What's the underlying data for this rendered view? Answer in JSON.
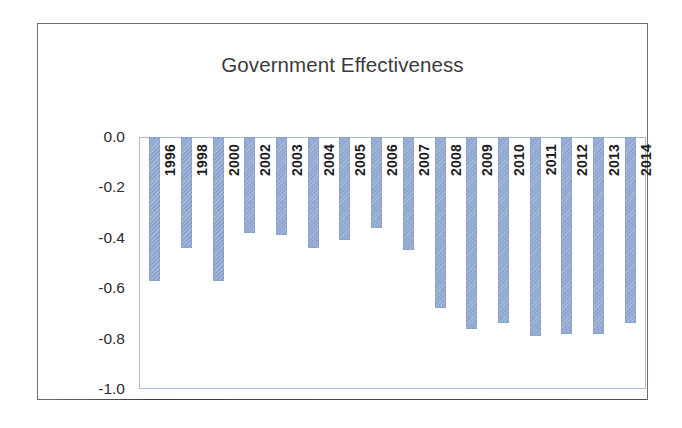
{
  "chart_data": {
    "type": "bar",
    "title": "Government Effectiveness",
    "xlabel": "",
    "ylabel": "",
    "ylim": [
      -1.0,
      0.0
    ],
    "grid": false,
    "legend": null,
    "bar_color": "#8fa8d0",
    "plot_border_color": "#a8bcd8",
    "frame_color": "#6e6e70",
    "yticks": [
      "0.0",
      "-0.2",
      "-0.4",
      "-0.6",
      "-0.8",
      "-1.0"
    ],
    "ytick_values": [
      0.0,
      -0.2,
      -0.4,
      -0.6,
      -0.8,
      -1.0
    ],
    "categories": [
      "1996",
      "1998",
      "2000",
      "2002",
      "2003",
      "2004",
      "2005",
      "2006",
      "2007",
      "2008",
      "2009",
      "2010",
      "2011",
      "2012",
      "2013",
      "2014"
    ],
    "values": [
      -0.57,
      -0.44,
      -0.57,
      -0.38,
      -0.39,
      -0.44,
      -0.41,
      -0.36,
      -0.45,
      -0.68,
      -0.76,
      -0.74,
      -0.79,
      -0.78,
      -0.78,
      -0.74
    ]
  }
}
